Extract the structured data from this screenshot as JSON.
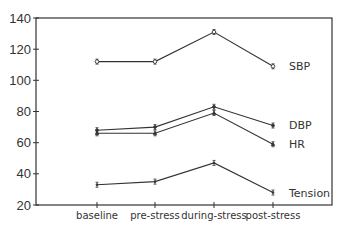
{
  "chart_data": {
    "type": "line",
    "title": "",
    "xlabel": "",
    "ylabel": "",
    "categories": [
      "baseline",
      "pre-stress",
      "during-stress",
      "post-stress"
    ],
    "ylim": [
      20,
      140
    ],
    "yticks": [
      20,
      40,
      60,
      80,
      100,
      120,
      140
    ],
    "grid": false,
    "legend_position": "inline-right",
    "series": [
      {
        "name": "SBP",
        "values": [
          112,
          112,
          131,
          109
        ],
        "marker": "open-circle"
      },
      {
        "name": "DBP",
        "values": [
          68,
          70,
          83,
          71
        ],
        "marker": "filled-dot"
      },
      {
        "name": "HR",
        "values": [
          66,
          66,
          79,
          59
        ],
        "marker": "filled-triangle"
      },
      {
        "name": "Tension",
        "values": [
          33,
          35,
          47,
          28
        ],
        "marker": "small-tick"
      }
    ]
  },
  "labels": {
    "y_ticks": [
      "20",
      "40",
      "60",
      "80",
      "100",
      "120",
      "140"
    ],
    "x_ticks": [
      "baseline",
      "pre-stress",
      "during-stress",
      "post-stress"
    ],
    "series": [
      "SBP",
      "DBP",
      "HR",
      "Tension"
    ]
  }
}
